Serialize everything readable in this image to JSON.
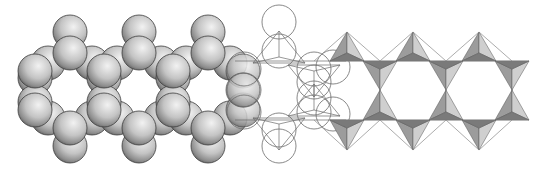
{
  "figure": {
    "title": "Silicate double chain (ribbon) — three representations",
    "panels": [
      {
        "id": "space-filling",
        "label": "Space-filling oxygen spheres"
      },
      {
        "id": "outline",
        "label": "Outline circles with tetrahedral bonds"
      },
      {
        "id": "polyhedral",
        "label": "Corner-sharing SiO4 tetrahedra"
      }
    ]
  },
  "colors": {
    "background": "#ffffff",
    "sphere_light": "#e6e6e6",
    "sphere_mid": "#a9a9a9",
    "sphere_dark": "#555555",
    "outline": "#6b6b6b",
    "tetra_light": "#cfcfcf",
    "tetra_mid": "#9c9c9c",
    "tetra_dark": "#7a7a7a"
  }
}
